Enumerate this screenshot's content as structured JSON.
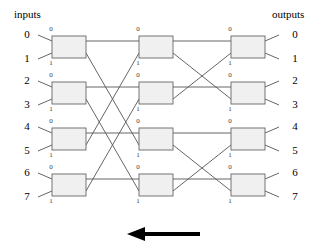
{
  "diagram": {
    "title_left": "inputs",
    "title_right": "outputs",
    "type": "butterfly-switching-network",
    "stages": 3,
    "rows": 4,
    "direction_arrow": "left",
    "colors": {
      "line": "#555555",
      "box_stroke": "#666666",
      "box_fill": "#f0f0f0",
      "arrow": "#000000",
      "text": "#000000",
      "port_text": "#3a3a3a"
    },
    "input_labels": [
      "0",
      "1",
      "2",
      "3",
      "4",
      "5",
      "6",
      "7"
    ],
    "output_labels": [
      "0",
      "1",
      "2",
      "3",
      "4",
      "5",
      "6",
      "7"
    ],
    "port_labels": {
      "top": "0",
      "bottom": "1"
    },
    "switch_boxes": [
      {
        "stage": 1,
        "row": 0,
        "top_port": "0",
        "bottom_port": "1"
      },
      {
        "stage": 1,
        "row": 1,
        "top_port": "0",
        "bottom_port": "1"
      },
      {
        "stage": 1,
        "row": 2,
        "top_port": "0",
        "bottom_port": "1"
      },
      {
        "stage": 1,
        "row": 3,
        "top_port": "0",
        "bottom_port": "1"
      },
      {
        "stage": 2,
        "row": 0,
        "top_port": "0",
        "bottom_port": "1"
      },
      {
        "stage": 2,
        "row": 1,
        "top_port": "0",
        "bottom_port": "1"
      },
      {
        "stage": 2,
        "row": 2,
        "top_port": "0",
        "bottom_port": "1"
      },
      {
        "stage": 2,
        "row": 3,
        "top_port": "0",
        "bottom_port": "1"
      },
      {
        "stage": 3,
        "row": 0,
        "top_port": "0",
        "bottom_port": "1"
      },
      {
        "stage": 3,
        "row": 1,
        "top_port": "0",
        "bottom_port": "1"
      },
      {
        "stage": 3,
        "row": 2,
        "top_port": "0",
        "bottom_port": "1"
      },
      {
        "stage": 3,
        "row": 3,
        "top_port": "0",
        "bottom_port": "1"
      }
    ]
  }
}
